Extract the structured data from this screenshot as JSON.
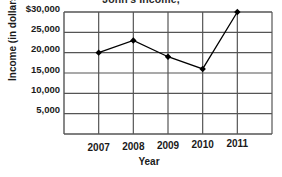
{
  "chart_data": {
    "type": "line",
    "title": "John's Income,",
    "xlabel": "Year",
    "ylabel": "Income (in dollars)",
    "categories": [
      "2007",
      "2008",
      "2009",
      "2010",
      "2011"
    ],
    "values": [
      20000,
      23000,
      19000,
      16000,
      30000
    ],
    "series": [
      {
        "name": "Income",
        "values": [
          20000,
          23000,
          19000,
          16000,
          30000
        ]
      }
    ],
    "ylim": [
      0,
      30000
    ],
    "ytick_values": [
      30000,
      25000,
      20000,
      15000,
      10000,
      5000
    ],
    "ytick_labels": [
      "$30,000",
      "25,000",
      "20,000",
      "15,000",
      "10,000",
      "5,000"
    ],
    "xtick_labels": [
      "2007",
      "2008",
      "2009",
      "2010",
      "2011"
    ],
    "grid": true,
    "legend": "none",
    "marker": "filled-diamond",
    "line_color": "#000000",
    "grid_color": "#555555",
    "background_color": "#ffffff"
  }
}
